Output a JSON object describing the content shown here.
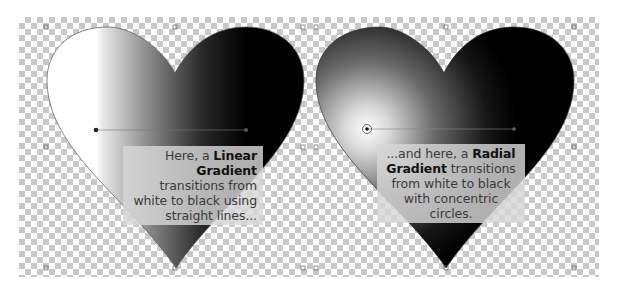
{
  "panels": [
    {
      "name": "linear-gradient-heart",
      "gradient_type": "linear",
      "from_color": "#ffffff",
      "to_color": "#000000",
      "caption": {
        "prefix": "Here, a ",
        "bold": "Linear Gradient",
        "suffix": " transitions from white to black using straight lines..."
      }
    },
    {
      "name": "radial-gradient-heart",
      "gradient_type": "radial",
      "from_color": "#ffffff",
      "to_color": "#000000",
      "caption": {
        "prefix": "...and here, a ",
        "bold": "Radial Gradient",
        "suffix": " transitions from white to black with concentric circles."
      }
    }
  ],
  "colors": {
    "checker_light": "#ffffff",
    "checker_dark": "#c8c8c8",
    "caption_bg": "#d7d7d7",
    "caption_text": "#3a3a3a"
  }
}
